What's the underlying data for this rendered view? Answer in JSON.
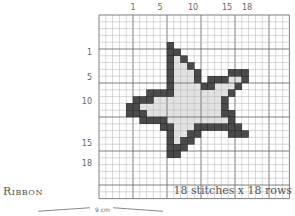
{
  "chart_data": {
    "type": "cross-stitch-chart",
    "title": "Ribbon",
    "caption": "18 stitches x 18 rows",
    "dimension_label": "9 cm",
    "grid": {
      "origin_x": 99,
      "origin_y": 15,
      "cols": 28,
      "rows": 27,
      "cell": 6.8,
      "major_every": 5,
      "line_color": "#b0b0b0",
      "major_line_color": "#707070"
    },
    "colors": {
      "outline": "#4a4a4a",
      "fill": "#e2e2e2"
    },
    "column_labels": [
      {
        "text": "1",
        "x": 133
      },
      {
        "text": "5",
        "x": 160
      },
      {
        "text": "10",
        "x": 193
      },
      {
        "text": "15",
        "x": 227
      },
      {
        "text": "18",
        "x": 247
      }
    ],
    "row_labels": [
      {
        "text": "1",
        "y": 52
      },
      {
        "text": "5",
        "y": 77
      },
      {
        "text": "10",
        "y": 101
      },
      {
        "text": "15",
        "y": 143
      },
      {
        "text": "18",
        "y": 163
      }
    ],
    "outline_cells": [
      [
        10,
        4
      ],
      [
        10,
        5
      ],
      [
        11,
        5
      ],
      [
        10,
        6
      ],
      [
        12,
        6
      ],
      [
        10,
        7
      ],
      [
        13,
        7
      ],
      [
        10,
        8
      ],
      [
        14,
        8
      ],
      [
        19,
        8
      ],
      [
        20,
        8
      ],
      [
        21,
        8
      ],
      [
        10,
        9
      ],
      [
        14,
        9
      ],
      [
        16,
        9
      ],
      [
        17,
        9
      ],
      [
        18,
        9
      ],
      [
        21,
        9
      ],
      [
        10,
        10
      ],
      [
        15,
        10
      ],
      [
        16,
        10
      ],
      [
        20,
        10
      ],
      [
        7,
        11
      ],
      [
        8,
        11
      ],
      [
        9,
        11
      ],
      [
        10,
        11
      ],
      [
        19,
        11
      ],
      [
        5,
        12
      ],
      [
        6,
        12
      ],
      [
        7,
        12
      ],
      [
        18,
        12
      ],
      [
        4,
        13
      ],
      [
        5,
        13
      ],
      [
        18,
        13
      ],
      [
        4,
        14
      ],
      [
        5,
        14
      ],
      [
        6,
        14
      ],
      [
        18,
        14
      ],
      [
        19,
        14
      ],
      [
        6,
        15
      ],
      [
        7,
        15
      ],
      [
        8,
        15
      ],
      [
        9,
        15
      ],
      [
        19,
        15
      ],
      [
        9,
        16
      ],
      [
        10,
        16
      ],
      [
        14,
        16
      ],
      [
        15,
        16
      ],
      [
        16,
        16
      ],
      [
        17,
        16
      ],
      [
        18,
        16
      ],
      [
        19,
        16
      ],
      [
        20,
        16
      ],
      [
        10,
        17
      ],
      [
        13,
        17
      ],
      [
        14,
        17
      ],
      [
        19,
        17
      ],
      [
        20,
        17
      ],
      [
        21,
        17
      ],
      [
        10,
        18
      ],
      [
        12,
        18
      ],
      [
        13,
        18
      ],
      [
        10,
        19
      ],
      [
        11,
        19
      ],
      [
        12,
        19
      ],
      [
        10,
        20
      ],
      [
        11,
        20
      ]
    ],
    "fill_cells": [
      [
        11,
        6
      ],
      [
        11,
        7
      ],
      [
        12,
        7
      ],
      [
        11,
        8
      ],
      [
        12,
        8
      ],
      [
        13,
        8
      ],
      [
        11,
        9
      ],
      [
        12,
        9
      ],
      [
        13,
        9
      ],
      [
        19,
        9
      ],
      [
        20,
        9
      ],
      [
        11,
        10
      ],
      [
        12,
        10
      ],
      [
        13,
        10
      ],
      [
        14,
        10
      ],
      [
        17,
        10
      ],
      [
        18,
        10
      ],
      [
        19,
        10
      ],
      [
        11,
        11
      ],
      [
        12,
        11
      ],
      [
        13,
        11
      ],
      [
        14,
        11
      ],
      [
        15,
        11
      ],
      [
        16,
        11
      ],
      [
        17,
        11
      ],
      [
        18,
        11
      ],
      [
        8,
        12
      ],
      [
        9,
        12
      ],
      [
        10,
        12
      ],
      [
        11,
        12
      ],
      [
        12,
        12
      ],
      [
        13,
        12
      ],
      [
        14,
        12
      ],
      [
        15,
        12
      ],
      [
        16,
        12
      ],
      [
        17,
        12
      ],
      [
        6,
        13
      ],
      [
        7,
        13
      ],
      [
        8,
        13
      ],
      [
        9,
        13
      ],
      [
        10,
        13
      ],
      [
        11,
        13
      ],
      [
        12,
        13
      ],
      [
        13,
        13
      ],
      [
        14,
        13
      ],
      [
        15,
        13
      ],
      [
        16,
        13
      ],
      [
        17,
        13
      ],
      [
        7,
        14
      ],
      [
        8,
        14
      ],
      [
        9,
        14
      ],
      [
        10,
        14
      ],
      [
        11,
        14
      ],
      [
        12,
        14
      ],
      [
        13,
        14
      ],
      [
        14,
        14
      ],
      [
        15,
        14
      ],
      [
        16,
        14
      ],
      [
        17,
        14
      ],
      [
        10,
        15
      ],
      [
        11,
        15
      ],
      [
        12,
        15
      ],
      [
        13,
        15
      ],
      [
        14,
        15
      ],
      [
        15,
        15
      ],
      [
        16,
        15
      ],
      [
        17,
        15
      ],
      [
        18,
        15
      ],
      [
        11,
        16
      ],
      [
        12,
        16
      ],
      [
        13,
        16
      ],
      [
        11,
        17
      ],
      [
        12,
        17
      ],
      [
        11,
        18
      ]
    ]
  }
}
